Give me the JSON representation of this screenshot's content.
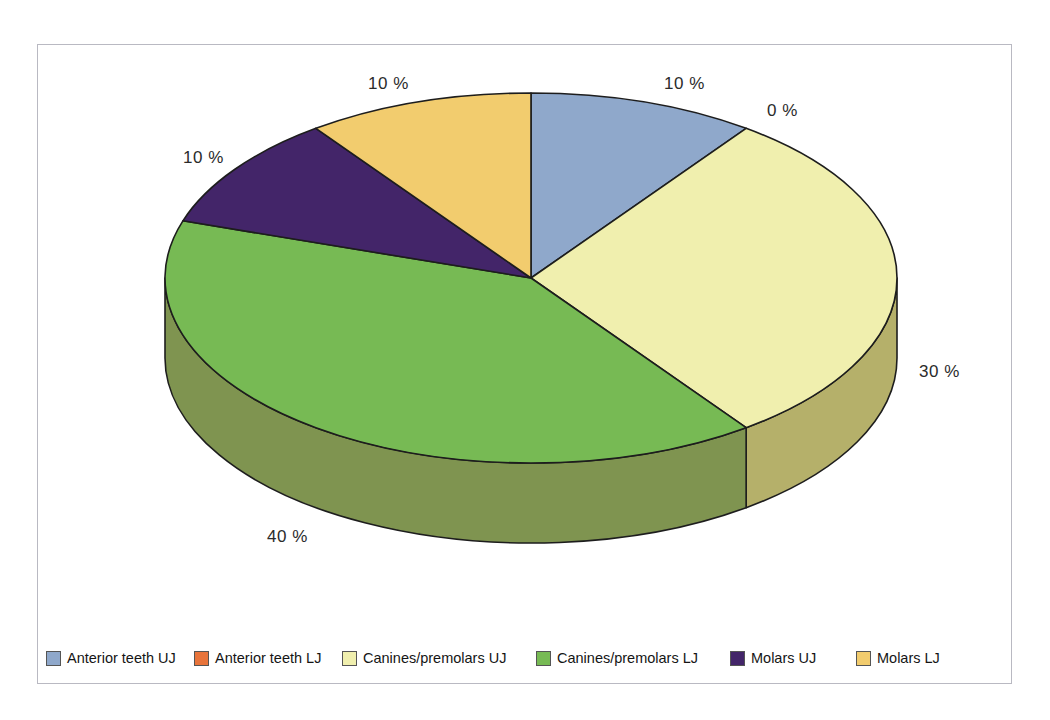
{
  "chart_data": {
    "type": "pie",
    "title": "",
    "categories": [
      "Anterior teeth UJ",
      "Anterior teeth LJ",
      "Canines/premolars UJ",
      "Canines/premolars LJ",
      "Molars UJ",
      "Molars LJ"
    ],
    "values": [
      10,
      0,
      30,
      40,
      10,
      10
    ],
    "value_labels": [
      "10 %",
      "0 %",
      "30 %",
      "40 %",
      "10 %",
      "10 %"
    ],
    "colors": [
      "#8FA8CB",
      "#E8743B",
      "#F0EFAE",
      "#77BA54",
      "#432569",
      "#F2CC6E"
    ],
    "side_colors": [
      "#6F87A8",
      "#B55B2D",
      "#B5B06A",
      "#7F9450",
      "#2E1A4A",
      "#C8A457"
    ],
    "unit": "%",
    "legend_position": "bottom",
    "grid": false,
    "three_d": true,
    "start_angle_deg": 0,
    "direction": "clockwise"
  },
  "labels": [
    {
      "text": "10 %",
      "x": 664,
      "y": 74,
      "series": "Anterior teeth UJ"
    },
    {
      "text": "0 %",
      "x": 767,
      "y": 101,
      "series": "Anterior teeth LJ"
    },
    {
      "text": "30 %",
      "x": 919,
      "y": 362,
      "series": "Canines/premolars UJ"
    },
    {
      "text": "40 %",
      "x": 267,
      "y": 527,
      "series": "Canines/premolars LJ"
    },
    {
      "text": "10 %",
      "x": 183,
      "y": 148,
      "series": "Molars UJ"
    },
    {
      "text": "10 %",
      "x": 368,
      "y": 74,
      "series": "Molars LJ"
    }
  ],
  "legend": {
    "items": [
      {
        "label": "Anterior teeth UJ",
        "color": "#8FA8CB",
        "x": 0
      },
      {
        "label": "Anterior teeth LJ",
        "color": "#E8743B",
        "x": 148
      },
      {
        "label": "Canines/premolars UJ",
        "color": "#F0EFAE",
        "x": 296
      },
      {
        "label": "Canines/premolars LJ",
        "color": "#77BA54",
        "x": 490
      },
      {
        "label": "Molars UJ",
        "color": "#432569",
        "x": 684
      },
      {
        "label": "Molars LJ",
        "color": "#F2CC6E",
        "x": 810
      }
    ]
  },
  "geometry": {
    "cx": 531,
    "cy": 278,
    "rx": 366,
    "ry": 185,
    "depth": 80
  }
}
